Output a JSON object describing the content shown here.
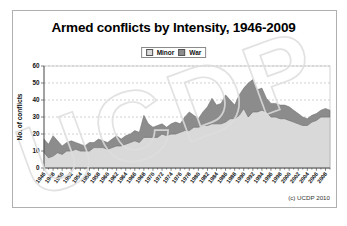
{
  "figure": {
    "title": "Armed conflicts by Intensity, 1946-2009",
    "attribution": "(c) UCDP 2010",
    "watermark": "UCDP"
  },
  "legend": {
    "items": [
      {
        "label": "Minor",
        "color": "#d9d9d9"
      },
      {
        "label": "War",
        "color": "#8c8c8c"
      }
    ]
  },
  "chart_data": {
    "type": "area",
    "stacked": true,
    "title": "Armed conflicts by Intensity, 1946-2009",
    "xlabel": "",
    "ylabel": "No. of conflicts",
    "ylim": [
      0,
      60
    ],
    "yticks": [
      0,
      10,
      20,
      30,
      40,
      50,
      60
    ],
    "grid": "dashed-horizontal",
    "legend_position": "top-center",
    "xticks": [
      "1946",
      "1948",
      "1950",
      "1952",
      "1954",
      "1956",
      "1958",
      "1960",
      "1962",
      "1964",
      "1966",
      "1968",
      "1970",
      "1972",
      "1974",
      "1976",
      "1978",
      "1980",
      "1982",
      "1984",
      "1986",
      "1988",
      "1990",
      "1992",
      "1994",
      "1996",
      "1998",
      "2000",
      "2002",
      "2004",
      "2006",
      "2008"
    ],
    "x": [
      1946,
      1947,
      1948,
      1949,
      1950,
      1951,
      1952,
      1953,
      1954,
      1955,
      1956,
      1957,
      1958,
      1959,
      1960,
      1961,
      1962,
      1963,
      1964,
      1965,
      1966,
      1967,
      1968,
      1969,
      1970,
      1971,
      1972,
      1973,
      1974,
      1975,
      1976,
      1977,
      1978,
      1979,
      1980,
      1981,
      1982,
      1983,
      1984,
      1985,
      1986,
      1987,
      1988,
      1989,
      1990,
      1991,
      1992,
      1993,
      1994,
      1995,
      1996,
      1997,
      1998,
      1999,
      2000,
      2001,
      2002,
      2003,
      2004,
      2005,
      2006,
      2007,
      2008,
      2009
    ],
    "series": [
      {
        "name": "Minor",
        "color": "#d9d9d9",
        "values": [
          9,
          6,
          7,
          9,
          8,
          10,
          10,
          11,
          10,
          10,
          10,
          12,
          12,
          12,
          11,
          12,
          13,
          13,
          14,
          15,
          16,
          15,
          18,
          18,
          18,
          18,
          20,
          19,
          20,
          20,
          21,
          22,
          22,
          24,
          24,
          25,
          25,
          26,
          26,
          26,
          27,
          29,
          29,
          31,
          35,
          30,
          33,
          33,
          34,
          33,
          30,
          30,
          29,
          29,
          28,
          27,
          26,
          25,
          25,
          27,
          28,
          30,
          30,
          30
        ]
      },
      {
        "name": "War",
        "color": "#8c8c8c",
        "values": [
          8,
          8,
          12,
          7,
          5,
          5,
          6,
          4,
          4,
          3,
          5,
          3,
          5,
          4,
          4,
          5,
          6,
          4,
          5,
          5,
          6,
          6,
          13,
          8,
          6,
          7,
          6,
          5,
          6,
          7,
          5,
          8,
          11,
          7,
          5,
          8,
          11,
          15,
          11,
          12,
          16,
          11,
          8,
          12,
          12,
          20,
          19,
          13,
          13,
          8,
          8,
          8,
          8,
          8,
          8,
          7,
          6,
          5,
          4,
          4,
          4,
          4,
          5,
          4
        ]
      }
    ],
    "plot_colors": {
      "gridline": "#bcbcbc",
      "axis": "#4a4a4a",
      "plot_border": "#c9c9c9",
      "area_edge_minor": "#9a9a9a",
      "area_edge_war": "#6b6b6b",
      "tick_text": "#111111",
      "watermark_stroke": "#dedede"
    }
  }
}
